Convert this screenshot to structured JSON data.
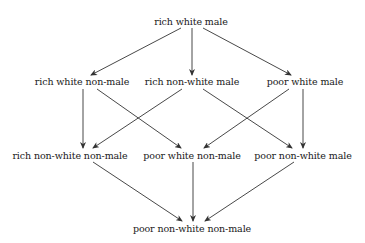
{
  "diagram": {
    "title": "",
    "type": "lattice",
    "nodes": [
      {
        "id": "n0",
        "label": "rich white male",
        "x": 191,
        "y": 16
      },
      {
        "id": "n1",
        "label": "rich white non-male",
        "x": 82,
        "y": 76
      },
      {
        "id": "n2",
        "label": "rich non-white  male",
        "x": 192,
        "y": 76
      },
      {
        "id": "n3",
        "label": "poor  white male",
        "x": 305,
        "y": 76
      },
      {
        "id": "n4",
        "label": "rich non-white  non-male",
        "x": 70,
        "y": 150
      },
      {
        "id": "n5",
        "label": "poor  white non-male",
        "x": 192,
        "y": 150
      },
      {
        "id": "n6",
        "label": "poor  non-white  male",
        "x": 303,
        "y": 150
      },
      {
        "id": "n7",
        "label": "poor  non-white  non-male",
        "x": 192,
        "y": 223
      }
    ],
    "edges": [
      {
        "from": "n0",
        "to": "n1"
      },
      {
        "from": "n0",
        "to": "n2"
      },
      {
        "from": "n0",
        "to": "n3"
      },
      {
        "from": "n1",
        "to": "n4"
      },
      {
        "from": "n1",
        "to": "n5"
      },
      {
        "from": "n2",
        "to": "n4"
      },
      {
        "from": "n2",
        "to": "n6"
      },
      {
        "from": "n3",
        "to": "n5"
      },
      {
        "from": "n3",
        "to": "n6"
      },
      {
        "from": "n4",
        "to": "n7"
      },
      {
        "from": "n5",
        "to": "n7"
      },
      {
        "from": "n6",
        "to": "n7"
      }
    ],
    "colors": {
      "line": "#333333",
      "text": "#1a1a1a",
      "background": "#ffffff"
    }
  }
}
